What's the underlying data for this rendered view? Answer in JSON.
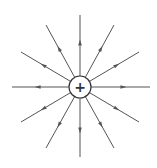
{
  "diagram": {
    "charge_symbol": "+",
    "center": [
      80,
      87
    ],
    "charge_radius": 11,
    "line_color": "#555555",
    "field_lines": [
      {
        "end": [
          80,
          15
        ]
      },
      {
        "end": [
          114,
          25
        ]
      },
      {
        "end": [
          139,
          52
        ]
      },
      {
        "end": [
          150,
          87
        ]
      },
      {
        "end": [
          139,
          122
        ]
      },
      {
        "end": [
          114,
          148
        ]
      },
      {
        "end": [
          80,
          157
        ]
      },
      {
        "end": [
          46,
          148
        ]
      },
      {
        "end": [
          21,
          122
        ]
      },
      {
        "end": [
          12,
          87
        ]
      },
      {
        "end": [
          21,
          52
        ]
      },
      {
        "end": [
          46,
          25
        ]
      }
    ],
    "arrow_direction": "outward"
  }
}
